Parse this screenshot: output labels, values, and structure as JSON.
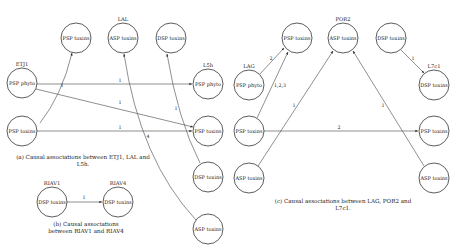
{
  "panels": {
    "a": {
      "caption_line1": "(a) Causal associations between ETJ1, LAL and",
      "caption_line2": "L5h.",
      "site_labels": {
        "etj1": "ETJ1",
        "lal": "LAL",
        "l5h": "L5h"
      },
      "nodes": [
        {
          "id": "a_etj1_psp_phyto",
          "label": "PSP phyto",
          "x": 22,
          "y": 83
        },
        {
          "id": "a_etj1_psp_toxins",
          "label": "PSP toxins",
          "x": 22,
          "y": 131
        },
        {
          "id": "a_top_psp_toxins",
          "label": "PSP toxins",
          "x": 76,
          "y": 38
        },
        {
          "id": "a_lal_asp_toxins",
          "label": "ASP toxins",
          "x": 123,
          "y": 38
        },
        {
          "id": "a_top_dsp_toxins",
          "label": "DSP toxins",
          "x": 171,
          "y": 38
        },
        {
          "id": "a_l5h_psp_phyto",
          "label": "PSP phyto",
          "x": 208,
          "y": 84
        },
        {
          "id": "a_l5h_psp_toxins",
          "label": "PSP toxins",
          "x": 208,
          "y": 131
        },
        {
          "id": "a_l5h_dsp_toxins",
          "label": "DSP toxins",
          "x": 208,
          "y": 177
        },
        {
          "id": "a_l5h_asp_toxins",
          "label": "ASP toxins",
          "x": 208,
          "y": 229
        }
      ],
      "edges": [
        {
          "from": "a_etj1_psp_toxins",
          "to": "a_top_psp_toxins",
          "label": "1"
        },
        {
          "from": "a_etj1_psp_phyto",
          "to": "a_l5h_psp_phyto",
          "label": "1"
        },
        {
          "from": "a_etj1_psp_phyto",
          "to": "a_l5h_psp_toxins",
          "label": "1"
        },
        {
          "from": "a_etj1_psp_toxins",
          "to": "a_l5h_psp_toxins",
          "label": "1"
        },
        {
          "from": "a_l5h_asp_toxins",
          "to": "a_lal_asp_toxins",
          "label": "4"
        },
        {
          "from": "a_l5h_dsp_toxins",
          "to": "a_top_dsp_toxins",
          "label": "1"
        }
      ]
    },
    "b": {
      "caption_line1": "(b) Causal associations",
      "caption_line2": "between RIAV1 and RIAV4",
      "site_labels": {
        "riav1": "RIAV1",
        "riav4": "RIAV4"
      },
      "nodes": [
        {
          "id": "b_riav1_dsp_toxins",
          "label": "DSP toxins",
          "x": 52,
          "y": 202
        },
        {
          "id": "b_riav4_dsp_toxins",
          "label": "DSP toxins",
          "x": 118,
          "y": 202
        }
      ],
      "edges": [
        {
          "from": "b_riav1_dsp_toxins",
          "to": "b_riav4_dsp_toxins",
          "label": "1"
        }
      ]
    },
    "c": {
      "caption_line1": "(c) Causal associations between LAG, POR2 and",
      "caption_line2": "L7c1.",
      "site_labels": {
        "lag": "LAG",
        "por2": "POR2",
        "l7c1": "L7c1"
      },
      "nodes": [
        {
          "id": "c_lag_psp_phyto",
          "label": "PSP phyto",
          "x": 249,
          "y": 85
        },
        {
          "id": "c_top_psp_toxins",
          "label": "PSP toxins",
          "x": 297,
          "y": 38
        },
        {
          "id": "c_por2_asp_toxins",
          "label": "ASP toxins",
          "x": 343,
          "y": 38
        },
        {
          "id": "c_top_dsp_toxins",
          "label": "DSP toxins",
          "x": 391,
          "y": 38
        },
        {
          "id": "c_l7c1_dsp_toxins",
          "label": "DSP toxins",
          "x": 434,
          "y": 85
        },
        {
          "id": "c_left_psp_toxins",
          "label": "PSP toxins",
          "x": 249,
          "y": 131
        },
        {
          "id": "c_left_asp_toxins",
          "label": "ASP toxins",
          "x": 249,
          "y": 178
        },
        {
          "id": "c_right_psp_toxins",
          "label": "PSP toxins",
          "x": 434,
          "y": 131
        },
        {
          "id": "c_right_asp_toxins",
          "label": "ASP toxins",
          "x": 434,
          "y": 178
        }
      ],
      "edges": [
        {
          "from": "c_lag_psp_phyto",
          "to": "c_top_psp_toxins",
          "label": "2"
        },
        {
          "from": "c_left_psp_toxins",
          "to": "c_top_psp_toxins",
          "label": "1,2,3"
        },
        {
          "from": "c_left_asp_toxins",
          "to": "c_por2_asp_toxins",
          "label": "1"
        },
        {
          "from": "c_right_asp_toxins",
          "to": "c_por2_asp_toxins",
          "label": "1"
        },
        {
          "from": "c_top_dsp_toxins",
          "to": "c_l7c1_dsp_toxins",
          "label": "1"
        },
        {
          "from": "c_left_psp_toxins",
          "to": "c_right_psp_toxins",
          "label": "2"
        }
      ]
    }
  }
}
